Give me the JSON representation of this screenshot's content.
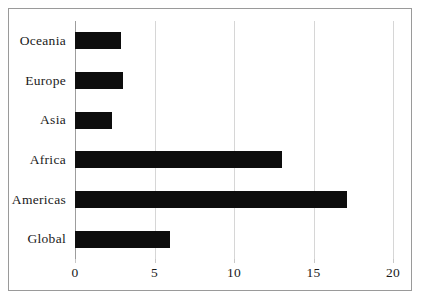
{
  "figure": {
    "background_color": "#ffffff",
    "frame_color": "#9a9a9a",
    "bar_color": "#0d0d0d",
    "gridline_color": "#d6d6d6",
    "axis_color": "#9d9d9d"
  },
  "chart_data": {
    "type": "bar",
    "orientation": "horizontal",
    "title": "",
    "subtitle": "",
    "xlabel": "",
    "ylabel": "",
    "categories": [
      "Global",
      "Americas",
      "Africa",
      "Asia",
      "Europe",
      "Oceania"
    ],
    "values": [
      6.0,
      17.1,
      13.0,
      2.3,
      3.0,
      2.9
    ],
    "series": [
      {
        "name": "",
        "values": [
          6.0,
          17.1,
          13.0,
          2.3,
          3.0,
          2.9
        ]
      }
    ],
    "xlim": [
      0,
      20
    ],
    "xticks": [
      0,
      5,
      10,
      15,
      20
    ],
    "xtick_labels": [
      "0",
      "5",
      "10",
      "15",
      "20"
    ],
    "grid": true,
    "grid_axis": "x",
    "legend": false,
    "legend_position": "none",
    "annotations": []
  }
}
